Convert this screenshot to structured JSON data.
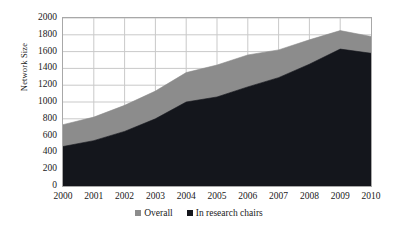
{
  "chart_data": {
    "type": "area",
    "title": "",
    "subtitle": "",
    "xlabel": "",
    "ylabel": "Network Size",
    "x": [
      2000,
      2001,
      2002,
      2003,
      2004,
      2005,
      2006,
      2007,
      2008,
      2009,
      2010
    ],
    "xtick_labels": [
      "2000",
      "2001",
      "2002",
      "2003",
      "2004",
      "2005",
      "2006",
      "2007",
      "2008",
      "2009",
      "2010"
    ],
    "ytick_labels": [
      "0",
      "200",
      "400",
      "600",
      "800",
      "1000",
      "1200",
      "1400",
      "1600",
      "1800",
      "2000"
    ],
    "ytick_values": [
      0,
      200,
      400,
      600,
      800,
      1000,
      1200,
      1400,
      1600,
      1800,
      2000
    ],
    "ylim": [
      0,
      2000
    ],
    "xlim": [
      2000,
      2010
    ],
    "grid": true,
    "grid_axes": "both",
    "legend_position": "bottom-center",
    "series": [
      {
        "name": "Overall",
        "color": "#8c8c8c",
        "values": [
          730,
          820,
          960,
          1130,
          1350,
          1440,
          1560,
          1620,
          1740,
          1850,
          1780
        ]
      },
      {
        "name": "In research chairs",
        "color": "#14161c",
        "values": [
          470,
          540,
          650,
          800,
          1000,
          1060,
          1180,
          1290,
          1450,
          1630,
          1580
        ]
      }
    ]
  },
  "legend": {
    "items": [
      {
        "label": "Overall",
        "color": "#8c8c8c"
      },
      {
        "label": "In research chairs",
        "color": "#14161c"
      }
    ]
  },
  "colors": {
    "overall": "#8c8c8c",
    "research_chairs": "#14161c",
    "grid": "#c9c9c9",
    "frame": "#a8a8a8",
    "text": "#1a1a1a",
    "background": "#ffffff"
  }
}
